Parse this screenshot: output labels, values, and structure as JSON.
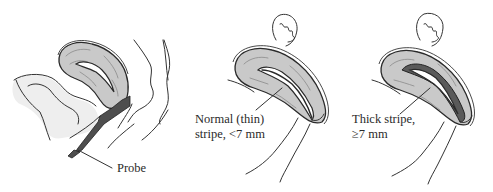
{
  "figure": {
    "panels": [
      {
        "id": "probe-placement",
        "description": "Sagittal view of pelvis with transvaginal ultrasound probe placed in vagina beneath uterus",
        "label": "Probe"
      },
      {
        "id": "thin-stripe",
        "description": "Uterus with normal thin endometrial stripe",
        "label_line1": "Normal (thin)",
        "label_line2": "stripe, <7 mm"
      },
      {
        "id": "thick-stripe",
        "description": "Uterus with thickened endometrial stripe",
        "label_line1": "Thick stripe,",
        "label_line2": "≥7 mm"
      }
    ]
  },
  "colors": {
    "uterus_fill": "#c9c9c9",
    "stripe_dark": "#5a5a5a",
    "probe": "#4e4e4e",
    "outline": "#2a2a2a"
  }
}
